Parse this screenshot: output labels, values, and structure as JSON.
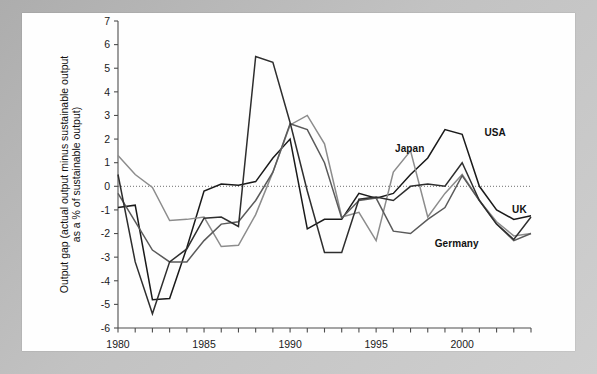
{
  "figure": {
    "background_color": "#bdbdbd",
    "panel_color": "#ffffff"
  },
  "chart_data": {
    "type": "line",
    "title": "",
    "xlabel": "",
    "ylabel": "Output gap (actual output minus sustainable output as a % of sustainable output)",
    "ylabel_line1": "Output gap (actual output minus sustainable output",
    "ylabel_line2": "as a % of sustainable output)",
    "xlim": [
      1980,
      2004
    ],
    "ylim": [
      -6,
      7
    ],
    "y_ticks": [
      7,
      6,
      5,
      4,
      3,
      2,
      1,
      0,
      -1,
      -2,
      -3,
      -4,
      -5,
      -6
    ],
    "y_tick_labels": [
      "7",
      "6",
      "5",
      "4",
      "3",
      "2",
      "1",
      "0",
      "-1",
      "-2",
      "-3",
      "-4",
      "-5",
      "-6"
    ],
    "x_ticks": [
      1980,
      1981,
      1982,
      1983,
      1984,
      1985,
      1986,
      1987,
      1988,
      1989,
      1990,
      1991,
      1992,
      1993,
      1994,
      1995,
      1996,
      1997,
      1998,
      1999,
      2000,
      2001,
      2002,
      2003,
      2004
    ],
    "x_tick_labels_shown": [
      "1980",
      "1985",
      "1990",
      "1995",
      "2000"
    ],
    "x_labeled_years": [
      1980,
      1985,
      1990,
      1995,
      2000
    ],
    "grid": false,
    "zero_line": true,
    "zero_line_style": "dotted",
    "legend_position": "inline-annotations",
    "x": [
      1980,
      1981,
      1982,
      1983,
      1984,
      1985,
      1986,
      1987,
      1988,
      1989,
      1990,
      1991,
      1992,
      1993,
      1994,
      1995,
      1996,
      1997,
      1998,
      1999,
      2000,
      2001,
      2002,
      2003,
      2004
    ],
    "series": [
      {
        "name": "USA",
        "color": "#1a1a1a",
        "values": [
          -0.9,
          -0.8,
          -4.8,
          -4.75,
          -2.6,
          -0.2,
          0.1,
          0.05,
          0.2,
          1.2,
          2.0,
          -1.8,
          -1.4,
          -1.4,
          -0.3,
          -0.5,
          -0.3,
          0.5,
          1.2,
          2.4,
          2.2,
          0.0,
          -1.0,
          -1.4,
          -1.25
        ]
      },
      {
        "name": "Japan",
        "color": "#8c8c8c",
        "values": [
          1.3,
          0.5,
          -0.05,
          -1.45,
          -1.4,
          -1.3,
          -2.55,
          -2.5,
          -1.2,
          0.6,
          2.6,
          3.0,
          1.8,
          -1.3,
          -1.1,
          -2.3,
          0.6,
          1.5,
          -1.3,
          -0.3,
          0.5,
          -0.6,
          -1.5,
          -2.1,
          -2.0
        ]
      },
      {
        "name": "Germany",
        "color": "#5a5a5a",
        "values": [
          -0.3,
          -1.5,
          -2.7,
          -3.2,
          -3.2,
          -2.3,
          -1.6,
          -1.5,
          -0.6,
          0.6,
          2.65,
          2.4,
          1.0,
          -1.35,
          -0.6,
          -0.5,
          -1.9,
          -2.0,
          -1.4,
          -0.9,
          0.45,
          -0.6,
          -1.6,
          -2.3,
          -2.0
        ]
      },
      {
        "name": "UK",
        "color": "#2e2e2e",
        "values": [
          0.5,
          -3.2,
          -5.4,
          -3.2,
          -2.65,
          -1.35,
          -1.3,
          -1.7,
          5.5,
          5.25,
          2.7,
          -0.2,
          -2.8,
          -2.8,
          -0.55,
          -0.45,
          -0.6,
          0.0,
          0.1,
          0.0,
          1.0,
          -0.6,
          -1.6,
          -2.25,
          -1.3
        ]
      }
    ],
    "annotations": [
      {
        "label": "USA",
        "x": 2001.3,
        "y": 2.2
      },
      {
        "label": "Japan",
        "x": 1996.1,
        "y": 1.55
      },
      {
        "label": "Germany",
        "x": 1998.4,
        "y": -2.5
      },
      {
        "label": "UK",
        "x": 2002.9,
        "y": -1.05
      }
    ]
  }
}
